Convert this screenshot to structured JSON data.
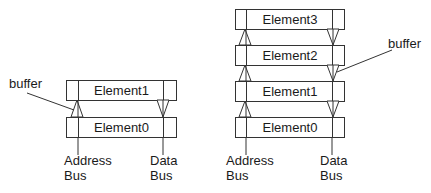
{
  "colors": {
    "stroke": "#333333",
    "text": "#1a1a1a",
    "background": "#ffffff"
  },
  "left_stack": {
    "elements": [
      {
        "label": "Element1",
        "x": 66,
        "y": 80,
        "w": 110,
        "h": 20,
        "divL": 78,
        "divR": 163
      },
      {
        "label": "Element0",
        "x": 66,
        "y": 117,
        "w": 110,
        "h": 20,
        "divL": 78,
        "divR": 163
      }
    ],
    "up_buffers": [
      {
        "cx": 77,
        "top": 100,
        "bottom": 117,
        "half": 6
      }
    ],
    "down_buffers": [
      {
        "cx": 163,
        "top": 100,
        "bottom": 117,
        "half": 6
      }
    ],
    "buffer_label": {
      "text": "buffer",
      "x": 9,
      "y": 76
    },
    "buffer_pointer": {
      "x1": 27,
      "y1": 93,
      "x2": 74,
      "y2": 110
    },
    "address_bus": {
      "line1": "Address",
      "line2": "Bus",
      "x": 64,
      "y": 153,
      "line_x": 78,
      "line_y1": 137,
      "line_y2": 155
    },
    "data_bus": {
      "line1": "Data",
      "line2": "Bus",
      "x": 150,
      "y": 153,
      "line_x": 163,
      "line_y1": 137,
      "line_y2": 155
    }
  },
  "right_stack": {
    "elements": [
      {
        "label": "Element3",
        "x": 235,
        "y": 9,
        "w": 109,
        "h": 20,
        "divL": 246,
        "divR": 332
      },
      {
        "label": "Element2",
        "x": 235,
        "y": 45,
        "w": 109,
        "h": 20,
        "divL": 246,
        "divR": 332
      },
      {
        "label": "Element1",
        "x": 235,
        "y": 81,
        "w": 109,
        "h": 20,
        "divL": 246,
        "divR": 332
      },
      {
        "label": "Element0",
        "x": 235,
        "y": 117,
        "w": 109,
        "h": 20,
        "divL": 246,
        "divR": 332
      }
    ],
    "up_buffers": [
      {
        "cx": 245,
        "top": 29,
        "bottom": 45,
        "half": 6
      },
      {
        "cx": 245,
        "top": 65,
        "bottom": 81,
        "half": 6
      },
      {
        "cx": 245,
        "top": 101,
        "bottom": 117,
        "half": 6
      }
    ],
    "down_buffers": [
      {
        "cx": 333,
        "top": 29,
        "bottom": 45,
        "half": 6
      },
      {
        "cx": 333,
        "top": 65,
        "bottom": 81,
        "half": 6
      },
      {
        "cx": 333,
        "top": 101,
        "bottom": 117,
        "half": 6
      }
    ],
    "buffer_label": {
      "text": "buffer",
      "x": 388,
      "y": 36
    },
    "buffer_pointer": {
      "x1": 392,
      "y1": 50,
      "x2": 337,
      "y2": 72
    },
    "address_bus": {
      "line1": "Address",
      "line2": "Bus",
      "x": 226,
      "y": 153,
      "line_x": 246,
      "line_y1": 137,
      "line_y2": 155
    },
    "data_bus": {
      "line1": "Data",
      "line2": "Bus",
      "x": 320,
      "y": 153,
      "line_x": 332,
      "line_y1": 137,
      "line_y2": 155
    }
  }
}
